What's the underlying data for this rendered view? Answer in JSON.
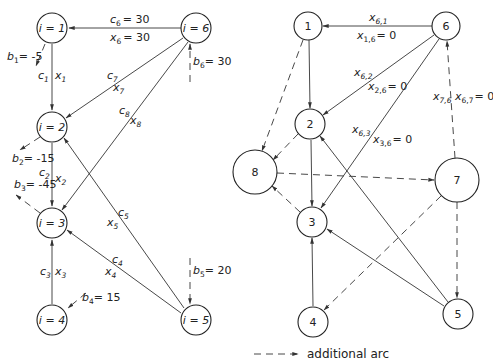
{
  "left_graph": {
    "nodes": [
      {
        "id": "i1",
        "label": "i = 1"
      },
      {
        "id": "i2",
        "label": "i = 2"
      },
      {
        "id": "i3",
        "label": "i = 3"
      },
      {
        "id": "i4",
        "label": "i = 4"
      },
      {
        "id": "i5",
        "label": "i = 5"
      },
      {
        "id": "i6",
        "label": "i = 6"
      }
    ],
    "supplies": {
      "b1": {
        "var": "b",
        "sub": "1",
        "value": "= -5"
      },
      "b2": {
        "var": "b",
        "sub": "2",
        "value": "= -15"
      },
      "b3": {
        "var": "b",
        "sub": "3",
        "value": "= -45"
      },
      "b4": {
        "var": "b",
        "sub": "4",
        "value": "= 15"
      },
      "b5": {
        "var": "b",
        "sub": "5",
        "value": "= 20"
      },
      "b6": {
        "var": "b",
        "sub": "6",
        "value": "= 30"
      }
    },
    "arcs": {
      "a1": {
        "from": "i1",
        "to": "i2",
        "c": "1",
        "x": "1"
      },
      "a2": {
        "from": "i2",
        "to": "i3",
        "c": "2",
        "x": "2"
      },
      "a3": {
        "from": "i4",
        "to": "i3",
        "c": "3",
        "x": "3"
      },
      "a4": {
        "from": "i5",
        "to": "i3",
        "c": "4",
        "x": "4"
      },
      "a5": {
        "from": "i5",
        "to": "i2",
        "c": "5",
        "x": "5"
      },
      "a6": {
        "from": "i6",
        "to": "i1",
        "c": "6",
        "x": "6",
        "c_value": "= 30",
        "x_value": "= 30"
      },
      "a7": {
        "from": "i6",
        "to": "i2",
        "c": "7",
        "x": "7"
      },
      "a8": {
        "from": "i6",
        "to": "i3",
        "c": "8",
        "x": "8"
      }
    }
  },
  "right_graph": {
    "nodes": [
      {
        "id": "n1",
        "label": "1"
      },
      {
        "id": "n2",
        "label": "2"
      },
      {
        "id": "n3",
        "label": "3"
      },
      {
        "id": "n4",
        "label": "4"
      },
      {
        "id": "n5",
        "label": "5"
      },
      {
        "id": "n6",
        "label": "6"
      },
      {
        "id": "n7",
        "label": "7"
      },
      {
        "id": "n8",
        "label": "8"
      }
    ],
    "arc_labels": {
      "x61": {
        "var": "x",
        "sub": "6,1",
        "value": ""
      },
      "x16": {
        "var": "x",
        "sub": "1,6",
        "value": "= 0"
      },
      "x62": {
        "var": "x",
        "sub": "6,2",
        "value": ""
      },
      "x26": {
        "var": "x",
        "sub": "2,6",
        "value": "= 0"
      },
      "x63": {
        "var": "x",
        "sub": "6,3",
        "value": ""
      },
      "x36": {
        "var": "x",
        "sub": "3,6",
        "value": "= 0"
      },
      "x76": {
        "var": "x",
        "sub": "7,6",
        "value": ""
      },
      "x67": {
        "var": "x",
        "sub": "6,7",
        "value": "= 0"
      }
    },
    "solid_arcs": [
      [
        "6",
        "1"
      ],
      [
        "1",
        "2"
      ],
      [
        "6",
        "2"
      ],
      [
        "6",
        "3"
      ],
      [
        "2",
        "3"
      ],
      [
        "4",
        "3"
      ],
      [
        "5",
        "3"
      ],
      [
        "5",
        "2"
      ]
    ],
    "dashed_arcs": [
      [
        "1",
        "8"
      ],
      [
        "2",
        "8"
      ],
      [
        "3",
        "8"
      ],
      [
        "8",
        "7"
      ],
      [
        "7",
        "6"
      ],
      [
        "7",
        "5"
      ],
      [
        "7",
        "4"
      ]
    ]
  },
  "legend": {
    "label": "additional arc"
  }
}
